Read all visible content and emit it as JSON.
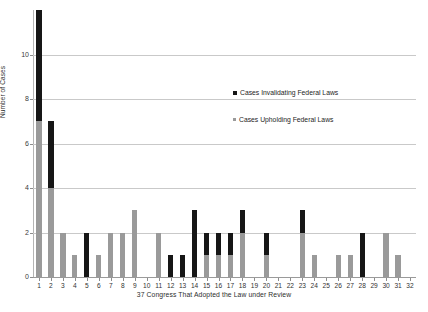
{
  "chart_data": {
    "type": "bar",
    "stacked": true,
    "title": "",
    "xlabel": "37 Congress That Adopted the Law under Review",
    "ylabel": "Number of Cases",
    "ylim": [
      0,
      12
    ],
    "yticks": [
      0,
      2,
      4,
      6,
      8,
      10
    ],
    "grid": "horizontal",
    "legend_position": "inside-upper-right",
    "categories": [
      "1",
      "2",
      "3",
      "4",
      "5",
      "6",
      "7",
      "8",
      "9",
      "10",
      "11",
      "12",
      "13",
      "14",
      "15",
      "16",
      "17",
      "18",
      "19",
      "20",
      "21",
      "22",
      "23",
      "24",
      "25",
      "26",
      "27",
      "28",
      "29",
      "30",
      "31",
      "32"
    ],
    "series": [
      {
        "name": "Cases Upholding Federal Laws",
        "color": "#9a9a9a",
        "values": [
          7,
          4,
          2,
          1,
          0,
          1,
          2,
          2,
          3,
          0,
          2,
          0,
          0,
          0,
          1,
          1,
          1,
          2,
          0,
          1,
          0,
          0,
          2,
          1,
          0,
          1,
          1,
          0,
          0,
          2,
          1,
          0
        ]
      },
      {
        "name": "Cases Invalidating Federal Laws",
        "color": "#161616",
        "values": [
          5,
          3,
          0,
          0,
          2,
          0,
          0,
          0,
          0,
          0,
          0,
          1,
          1,
          3,
          1,
          1,
          1,
          1,
          0,
          1,
          0,
          0,
          1,
          0,
          0,
          0,
          0,
          2,
          0,
          0,
          0,
          0
        ]
      }
    ],
    "totals": [
      12,
      7,
      2,
      1,
      2,
      1,
      2,
      2,
      3,
      0,
      2,
      1,
      1,
      3,
      2,
      2,
      2,
      3,
      0,
      2,
      0,
      0,
      3,
      1,
      0,
      1,
      1,
      2,
      0,
      2,
      1,
      0
    ]
  },
  "legend": {
    "invalidating_label": "Cases Invalidating Federal Laws",
    "upholding_label": "Cases Upholding Federal Laws"
  },
  "axes": {
    "y_title": "Number of Cases",
    "x_title": "37 Congress That Adopted the Law under Review"
  },
  "colors": {
    "invalidating": "#161616",
    "upholding": "#9a9a9a",
    "gridline": "#c9c9c9",
    "background": "#ffffff"
  }
}
